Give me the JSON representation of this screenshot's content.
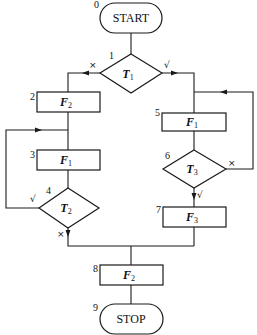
{
  "flowchart": {
    "nodes": [
      {
        "id": 0,
        "type": "terminal",
        "label": "START"
      },
      {
        "id": 1,
        "type": "decision",
        "label": "T",
        "sub": "1"
      },
      {
        "id": 2,
        "type": "process",
        "label": "F",
        "sub": "2"
      },
      {
        "id": 3,
        "type": "process",
        "label": "F",
        "sub": "1"
      },
      {
        "id": 4,
        "type": "decision",
        "label": "T",
        "sub": "2"
      },
      {
        "id": 5,
        "type": "process",
        "label": "F",
        "sub": "1"
      },
      {
        "id": 6,
        "type": "decision",
        "label": "T",
        "sub": "3"
      },
      {
        "id": 7,
        "type": "process",
        "label": "F",
        "sub": "3"
      },
      {
        "id": 8,
        "type": "process",
        "label": "F",
        "sub": "2"
      },
      {
        "id": 9,
        "type": "terminal",
        "label": "STOP"
      }
    ],
    "node_numbers": [
      "0",
      "1",
      "2",
      "3",
      "4",
      "5",
      "6",
      "7",
      "8",
      "9"
    ],
    "marks": {
      "true": "√",
      "false": "×"
    },
    "edges": [
      {
        "from": 0,
        "to": 1
      },
      {
        "from": 1,
        "to": 2,
        "condition": "×"
      },
      {
        "from": 1,
        "to": 5,
        "condition": "√"
      },
      {
        "from": 2,
        "to": 3
      },
      {
        "from": 3,
        "to": 4
      },
      {
        "from": 4,
        "to": 3,
        "condition": "√"
      },
      {
        "from": 4,
        "to": 8,
        "condition": "×"
      },
      {
        "from": 5,
        "to": 6
      },
      {
        "from": 6,
        "to": 5,
        "condition": "×"
      },
      {
        "from": 6,
        "to": 7,
        "condition": "√"
      },
      {
        "from": 7,
        "to": 8
      },
      {
        "from": 8,
        "to": 9
      }
    ]
  }
}
